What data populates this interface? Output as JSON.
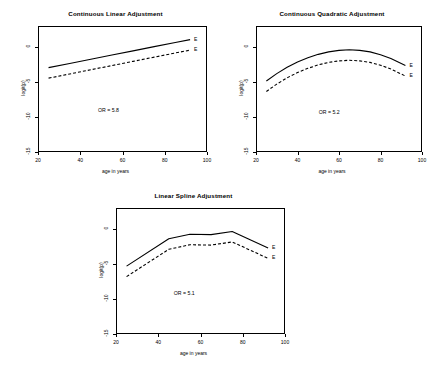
{
  "figure": {
    "background": "#ffffff",
    "line_color": "#000000"
  },
  "chart_data": [
    {
      "type": "line",
      "panel_id": "continuous-linear",
      "title": "Continuous Linear Adjustment",
      "xlabel": "age in years",
      "ylabel": "logit(p)",
      "xlim": [
        20,
        100
      ],
      "ylim": [
        -15,
        3
      ],
      "xticks": [
        20,
        40,
        60,
        80,
        100
      ],
      "yticks": [
        0,
        -5,
        -10,
        -15
      ],
      "grid": false,
      "annotation": "OR = 5.8",
      "annotation_x": 55,
      "annotation_y": -9.2,
      "legend_position": "right-inline",
      "series": [
        {
          "name": "E = 1",
          "label": "E",
          "style": "solid",
          "x": [
            25,
            35,
            45,
            55,
            65,
            75,
            85,
            92
          ],
          "values": [
            -2.95,
            -2.35,
            -1.75,
            -1.15,
            -0.55,
            0.05,
            0.65,
            1.05
          ]
        },
        {
          "name": "E = 0",
          "label": "E",
          "style": "dashed",
          "x": [
            25,
            35,
            45,
            55,
            65,
            75,
            85,
            92
          ],
          "values": [
            -4.45,
            -3.85,
            -3.25,
            -2.65,
            -2.05,
            -1.45,
            -0.85,
            -0.45
          ]
        }
      ]
    },
    {
      "type": "line",
      "panel_id": "continuous-quadratic",
      "title": "Continuous Quadratic Adjustment",
      "xlabel": "age in years",
      "ylabel": "logit(p)",
      "xlim": [
        20,
        100
      ],
      "ylim": [
        -15,
        3
      ],
      "xticks": [
        20,
        40,
        60,
        80,
        100
      ],
      "yticks": [
        0,
        -5,
        -10,
        -15
      ],
      "grid": false,
      "annotation": "OR = 5.2",
      "annotation_x": 57,
      "annotation_y": -9.4,
      "legend_position": "right-inline",
      "series": [
        {
          "name": "E = 1",
          "label": "E",
          "style": "solid",
          "x": [
            25,
            30,
            35,
            40,
            45,
            50,
            55,
            60,
            65,
            70,
            75,
            80,
            85,
            92
          ],
          "values": [
            -4.85,
            -3.8,
            -2.9,
            -2.15,
            -1.55,
            -1.05,
            -0.7,
            -0.48,
            -0.4,
            -0.48,
            -0.7,
            -1.1,
            -1.65,
            -2.65
          ]
        },
        {
          "name": "E = 0",
          "label": "E",
          "style": "dashed",
          "x": [
            25,
            30,
            35,
            40,
            45,
            50,
            55,
            60,
            65,
            70,
            75,
            80,
            85,
            92
          ],
          "values": [
            -6.35,
            -5.3,
            -4.4,
            -3.65,
            -3.05,
            -2.55,
            -2.2,
            -1.98,
            -1.9,
            -1.98,
            -2.2,
            -2.6,
            -3.15,
            -4.15
          ]
        }
      ]
    },
    {
      "type": "line",
      "panel_id": "linear-spline",
      "title": "Linear Spline Adjustment",
      "xlabel": "age in years",
      "ylabel": "logit(p)",
      "xlim": [
        20,
        100
      ],
      "ylim": [
        -15,
        3
      ],
      "xticks": [
        20,
        40,
        60,
        80,
        100
      ],
      "yticks": [
        0,
        -5,
        -10,
        -15
      ],
      "grid": false,
      "annotation": "OR = 5.1",
      "annotation_x": 54,
      "annotation_y": -9.3,
      "legend_position": "right-inline",
      "series": [
        {
          "name": "E = 1",
          "label": "E",
          "style": "solid",
          "x": [
            25,
            45,
            55,
            65,
            75,
            92
          ],
          "values": [
            -5.3,
            -1.4,
            -0.75,
            -0.8,
            -0.35,
            -2.7
          ]
        },
        {
          "name": "E = 0",
          "label": "E",
          "style": "dashed",
          "x": [
            25,
            45,
            55,
            65,
            75,
            92
          ],
          "values": [
            -6.8,
            -2.9,
            -2.25,
            -2.3,
            -1.85,
            -4.2
          ]
        }
      ]
    }
  ]
}
